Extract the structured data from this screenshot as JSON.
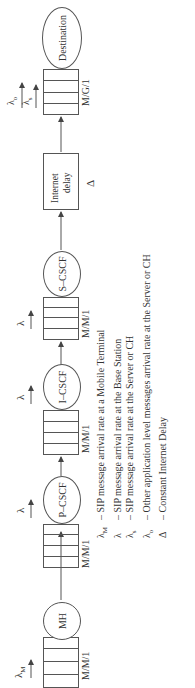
{
  "diagram": {
    "nodes": [
      {
        "id": "mh",
        "label": "MH",
        "queue_model": "M/M/1",
        "arrival": "λ",
        "arrival_sub": "M"
      },
      {
        "id": "pcscf",
        "label": "P–CSCF",
        "queue_model": "M/M/1",
        "arrival": "λ",
        "arrival_sub": ""
      },
      {
        "id": "icscf",
        "label": "I–CSCF",
        "queue_model": "M/M/1",
        "arrival": "λ",
        "arrival_sub": ""
      },
      {
        "id": "scscf",
        "label": "S–CSCF",
        "queue_model": "M/M/1",
        "arrival": "λ",
        "arrival_sub": ""
      },
      {
        "id": "internet",
        "label_line1": "Internet",
        "label_line2": "delay",
        "symbol": "Δ"
      },
      {
        "id": "destination",
        "label": "Destination",
        "queue_model": "M/G/1",
        "arrivals": [
          {
            "sym": "λ",
            "sub": "o"
          },
          {
            "sym": "λ",
            "sub": "s"
          }
        ]
      }
    ],
    "legend": [
      {
        "sym": "λ",
        "sub": "M",
        "text": "– SIP message arrival rate at a Mobile Terminal"
      },
      {
        "sym": "λ",
        "sub": "",
        "text": "– SIP message arrival rate at the Base Station"
      },
      {
        "sym": "λ",
        "sub": "s",
        "text": "– SIP message arrival rate at the Server or CH"
      },
      {
        "sym": "λ",
        "sub": "o",
        "text": "– Other application level messages arrival rate at the Server or CH"
      },
      {
        "sym": "Δ",
        "sub": "",
        "text": "– Constant Internet Delay"
      }
    ]
  }
}
